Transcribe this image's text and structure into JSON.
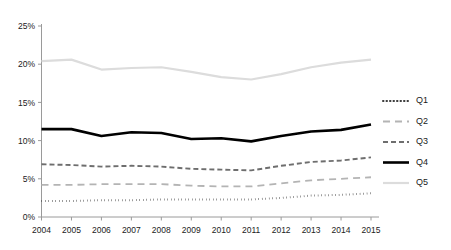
{
  "chart_data": {
    "type": "line",
    "title": "",
    "subtitle": "",
    "xlabel": "",
    "ylabel": "",
    "grid": false,
    "legend_position": "right",
    "x": [
      "2004",
      "2005",
      "2006",
      "2007",
      "2008",
      "2009",
      "2010",
      "2011",
      "2012",
      "2013",
      "2014",
      "2015"
    ],
    "categories": [
      "2004",
      "2005",
      "2006",
      "2007",
      "2008",
      "2009",
      "2010",
      "2011",
      "2012",
      "2013",
      "2014",
      "2015"
    ],
    "ylim": [
      0,
      25
    ],
    "ytick_values": [
      0,
      5,
      10,
      15,
      20,
      25
    ],
    "ytick_labels": [
      "0%",
      "5%",
      "10%",
      "15%",
      "20%",
      "25%"
    ],
    "xtick_labels": [
      "2004",
      "2005",
      "2006",
      "2007",
      "2008",
      "2009",
      "2010",
      "2011",
      "2012",
      "2013",
      "2014",
      "2015"
    ],
    "value_suffix": "%",
    "series": [
      {
        "name": "Q1",
        "style": "dotted",
        "color": "#3a3a3a",
        "width": 2.0,
        "dash": "0.5,3",
        "values": [
          2.1,
          2.1,
          2.2,
          2.2,
          2.3,
          2.3,
          2.3,
          2.3,
          2.5,
          2.8,
          2.9,
          3.1
        ]
      },
      {
        "name": "Q2",
        "style": "dashed-light",
        "color": "#b4b4b4",
        "width": 1.8,
        "dash": "7,5",
        "values": [
          4.2,
          4.2,
          4.3,
          4.3,
          4.3,
          4.1,
          4.0,
          4.0,
          4.4,
          4.8,
          5.0,
          5.2
        ]
      },
      {
        "name": "Q3",
        "style": "dashed-medium",
        "color": "#6e6e6e",
        "width": 1.9,
        "dash": "5,3",
        "values": [
          6.9,
          6.8,
          6.6,
          6.7,
          6.6,
          6.3,
          6.2,
          6.1,
          6.7,
          7.2,
          7.4,
          7.8
        ]
      },
      {
        "name": "Q4",
        "style": "solid-bold",
        "color": "#000000",
        "width": 2.6,
        "dash": "none",
        "values": [
          11.5,
          11.5,
          10.6,
          11.1,
          11.0,
          10.2,
          10.3,
          9.9,
          10.6,
          11.2,
          11.4,
          12.1
        ]
      },
      {
        "name": "Q5",
        "style": "solid-light",
        "color": "#dcdcdc",
        "width": 2.2,
        "dash": "none",
        "values": [
          20.4,
          20.6,
          19.3,
          19.5,
          19.6,
          19.0,
          18.3,
          18.0,
          18.7,
          19.6,
          20.2,
          20.6
        ]
      }
    ],
    "legend": [
      {
        "label": "Q1"
      },
      {
        "label": "Q2"
      },
      {
        "label": "Q3"
      },
      {
        "label": "Q4"
      },
      {
        "label": "Q5"
      }
    ],
    "colors": {
      "axis": "#9a9a9a",
      "text": "#222222",
      "background": "#ffffff"
    }
  }
}
